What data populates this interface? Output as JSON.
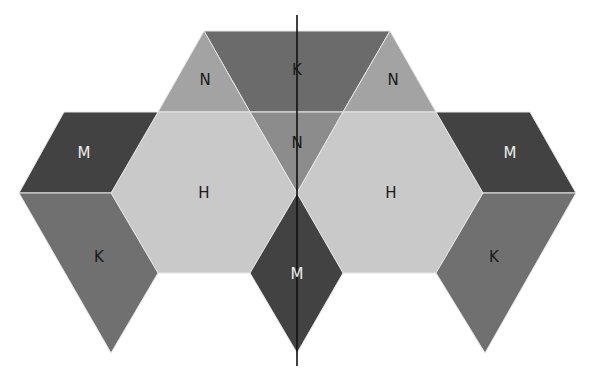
{
  "diagram": {
    "type": "tessellation net of hexagons, rhombi and triangles with vertical axis of symmetry",
    "colors": {
      "H": "#c9c9c9",
      "N": "#a3a3a3",
      "N_center": "#8c8c8c",
      "K": "#707070",
      "K_top": "#6b6b6b",
      "M": "#424242",
      "axis": "#111111",
      "label_dark": "#1a1a1a",
      "label_light": "#eeeeee"
    },
    "pieces": [
      {
        "id": "top-k-trapezoid",
        "label": "K"
      },
      {
        "id": "top-left-n-triangle",
        "label": "N"
      },
      {
        "id": "top-right-n-triangle",
        "label": "N"
      },
      {
        "id": "center-n-triangle",
        "label": "N"
      },
      {
        "id": "left-h-hexagon",
        "label": "H"
      },
      {
        "id": "right-h-hexagon",
        "label": "H"
      },
      {
        "id": "left-m-rhombus",
        "label": "M"
      },
      {
        "id": "right-m-rhombus",
        "label": "M"
      },
      {
        "id": "left-k-rhombus",
        "label": "K"
      },
      {
        "id": "right-k-rhombus",
        "label": "K"
      },
      {
        "id": "bottom-m-rhombus",
        "label": "M"
      }
    ]
  }
}
